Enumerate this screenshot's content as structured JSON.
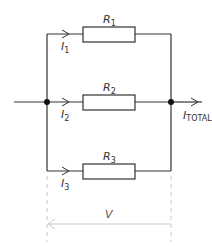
{
  "diagram": {
    "type": "parallel-resistor-circuit",
    "colors": {
      "wire": "#333333",
      "measure": "#c8c8c8",
      "text": "#333333"
    },
    "resistors": [
      {
        "label": "R",
        "sub": "1"
      },
      {
        "label": "R",
        "sub": "2"
      },
      {
        "label": "R",
        "sub": "3"
      }
    ],
    "currents": [
      {
        "label": "I",
        "sub": "1"
      },
      {
        "label": "I",
        "sub": "2"
      },
      {
        "label": "I",
        "sub": "3"
      }
    ],
    "total_current": {
      "label": "I",
      "sub": "TOTAL"
    },
    "voltage": {
      "label": "V"
    }
  }
}
